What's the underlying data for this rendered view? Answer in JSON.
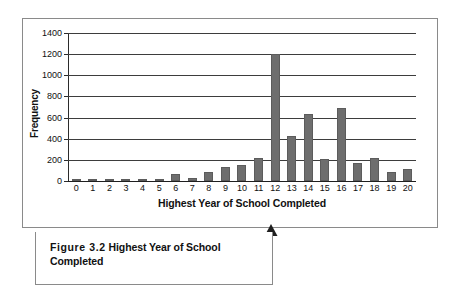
{
  "figure": {
    "caption_label": "Figure 3.2",
    "caption_title": "Highest Year of School Completed"
  },
  "chart_data": {
    "type": "bar",
    "title": "",
    "xlabel": "Highest Year of School Completed",
    "ylabel": "Frequency",
    "categories": [
      "0",
      "1",
      "2",
      "3",
      "4",
      "5",
      "6",
      "7",
      "8",
      "9",
      "10",
      "11",
      "12",
      "13",
      "14",
      "15",
      "16",
      "17",
      "18",
      "19",
      "20"
    ],
    "values": [
      12,
      3,
      15,
      16,
      4,
      13,
      70,
      30,
      88,
      130,
      155,
      215,
      1200,
      428,
      630,
      212,
      695,
      175,
      213,
      85,
      118
    ],
    "ylim": [
      0,
      1400
    ],
    "y_ticks": [
      0,
      200,
      400,
      600,
      800,
      1000,
      1200,
      1400
    ],
    "y_tick_labels": [
      "0",
      "200",
      "400",
      "600",
      "800",
      "1000",
      "1200",
      "1400"
    ],
    "grid": true,
    "legend": "none",
    "bar_color": "#6e6e6e",
    "axis_color": "#2b2b2b",
    "gridline_color": "#3d3d3d"
  }
}
